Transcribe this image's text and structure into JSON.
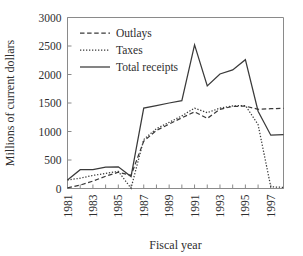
{
  "chart_data": {
    "type": "line",
    "title": "",
    "xlabel": "Fiscal year",
    "ylabel": "Millions of current dollars",
    "grid": false,
    "legend_position": "top-left",
    "xlim": [
      1981,
      1998
    ],
    "ylim": [
      0,
      3000
    ],
    "yticks": [
      0,
      500,
      1000,
      1500,
      2000,
      2500,
      3000
    ],
    "ytick_labels": [
      "0",
      "500",
      "1000",
      "1500",
      "2000",
      "2500",
      "3000"
    ],
    "xticks": [
      1981,
      1982,
      1983,
      1984,
      1985,
      1986,
      1987,
      1988,
      1989,
      1990,
      1991,
      1992,
      1993,
      1994,
      1995,
      1996,
      1997,
      1998
    ],
    "xtick_labels": [
      "1981",
      "",
      "1983",
      "",
      "1985",
      "",
      "1987",
      "",
      "1989",
      "",
      "1991",
      "",
      "1993",
      "",
      "1995",
      "",
      "1997",
      ""
    ],
    "x": [
      1981,
      1982,
      1983,
      1984,
      1985,
      1986,
      1987,
      1988,
      1989,
      1990,
      1991,
      1992,
      1993,
      1994,
      1995,
      1996,
      1997,
      1998
    ],
    "series": [
      {
        "name": "Outlays",
        "style": "dashed",
        "color": "#3a3a3a",
        "values": [
          10,
          60,
          130,
          215,
          285,
          230,
          830,
          1020,
          1130,
          1240,
          1345,
          1230,
          1390,
          1440,
          1445,
          1390,
          1400,
          1405
        ]
      },
      {
        "name": "Taxes",
        "style": "dotted",
        "color": "#3a3a3a",
        "values": [
          150,
          180,
          230,
          265,
          300,
          5,
          860,
          1050,
          1160,
          1275,
          1410,
          1330,
          1410,
          1450,
          1455,
          1120,
          30,
          20
        ]
      },
      {
        "name": "Total receipts",
        "style": "solid",
        "color": "#3a3a3a",
        "values": [
          150,
          330,
          330,
          375,
          380,
          210,
          1410,
          1455,
          1500,
          1540,
          2520,
          1800,
          2010,
          2080,
          2260,
          1355,
          935,
          945
        ]
      }
    ]
  },
  "legend": {
    "entries": [
      {
        "label": "Outlays",
        "style": "dashed"
      },
      {
        "label": "Taxes",
        "style": "dotted"
      },
      {
        "label": "Total receipts",
        "style": "solid"
      }
    ]
  },
  "colors": {
    "ink": "#3a3a3a",
    "frame": "#8a8a8a",
    "background": "#ffffff"
  }
}
